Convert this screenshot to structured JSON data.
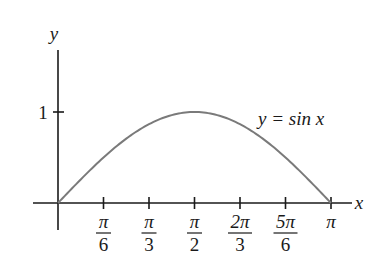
{
  "chart_data": {
    "type": "line",
    "title": "",
    "xlabel": "x",
    "ylabel": "y",
    "series": [
      {
        "name": "y = sin x",
        "x": [
          0,
          0.5236,
          1.0472,
          1.5708,
          2.0944,
          2.618,
          3.1416
        ],
        "values": [
          0,
          0.5,
          0.866,
          1,
          0.866,
          0.5,
          0
        ]
      }
    ],
    "x_ticks": [
      {
        "value": 0.5236,
        "num": "π",
        "den": "6"
      },
      {
        "value": 1.0472,
        "num": "π",
        "den": "3"
      },
      {
        "value": 1.5708,
        "num": "π",
        "den": "2"
      },
      {
        "value": 2.0944,
        "num": "2π",
        "den": "3"
      },
      {
        "value": 2.618,
        "num": "5π",
        "den": "6"
      },
      {
        "value": 3.1416,
        "num": "π",
        "den": ""
      }
    ],
    "y_ticks": [
      {
        "value": 1,
        "label": "1"
      }
    ],
    "xlim": [
      0,
      3.1416
    ],
    "ylim": [
      0,
      1
    ],
    "grid": false,
    "legend": "none",
    "annotations": [
      {
        "text": "y = sin x",
        "position": "right of peak"
      }
    ],
    "colors": {
      "curve": "#7a7a7a",
      "axes": "#1a1a1a"
    }
  },
  "labels": {
    "x_axis": "x",
    "y_axis": "y",
    "y_tick_1": "1",
    "curve": "y = sin x",
    "ticks": {
      "t1_num": "π",
      "t1_den": "6",
      "t2_num": "π",
      "t2_den": "3",
      "t3_num": "π",
      "t3_den": "2",
      "t4_num": "2π",
      "t4_den": "3",
      "t5_num": "5π",
      "t5_den": "6",
      "t6": "π"
    }
  }
}
